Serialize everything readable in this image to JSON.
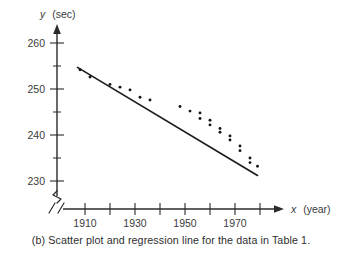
{
  "caption": "(b) Scatter plot and regression line for the data in Table 1.",
  "chart_data": {
    "type": "scatter",
    "title": "",
    "subtitle": "",
    "xlabel_var": "x",
    "xlabel_unit": "(year)",
    "ylabel_var": "y",
    "ylabel_unit": "(sec)",
    "xlabel": "x (year)",
    "ylabel": "y (sec)",
    "xlim": [
      1900,
      1982
    ],
    "ylim": [
      226,
      263
    ],
    "x_ticks_major": [
      1910,
      1930,
      1950,
      1970
    ],
    "x_ticks_all": [
      1910,
      1920,
      1930,
      1940,
      1950,
      1960,
      1970,
      1980
    ],
    "x_tick_labels": [
      "1910",
      "1930",
      "1950",
      "1970"
    ],
    "y_ticks_major": [
      230,
      240,
      250,
      260
    ],
    "y_ticks_minor": [
      235,
      245,
      255
    ],
    "y_tick_labels": [
      "230",
      "240",
      "250",
      "260"
    ],
    "grid": false,
    "legend": false,
    "axis_break_x": true,
    "axis_break_y": true,
    "points": [
      {
        "x": 1908,
        "y": 254.2
      },
      {
        "x": 1912,
        "y": 252.6
      },
      {
        "x": 1920,
        "y": 251.0
      },
      {
        "x": 1924,
        "y": 250.4
      },
      {
        "x": 1928,
        "y": 249.8
      },
      {
        "x": 1932,
        "y": 248.2
      },
      {
        "x": 1936,
        "y": 247.6
      },
      {
        "x": 1948,
        "y": 246.2
      },
      {
        "x": 1952,
        "y": 245.2
      },
      {
        "x": 1956,
        "y": 244.8
      },
      {
        "x": 1956,
        "y": 243.6
      },
      {
        "x": 1960,
        "y": 243.2
      },
      {
        "x": 1960,
        "y": 242.2
      },
      {
        "x": 1964,
        "y": 241.4
      },
      {
        "x": 1964,
        "y": 240.6
      },
      {
        "x": 1968,
        "y": 239.8
      },
      {
        "x": 1968,
        "y": 238.9
      },
      {
        "x": 1972,
        "y": 237.6
      },
      {
        "x": 1972,
        "y": 236.6
      },
      {
        "x": 1976,
        "y": 235.0
      },
      {
        "x": 1976,
        "y": 234.0
      },
      {
        "x": 1979,
        "y": 233.2
      }
    ],
    "regression_line": {
      "x_start": 1907,
      "y_start": 254.7,
      "x_end": 1979,
      "y_end": 231.2
    },
    "series": [
      {
        "name": "observations",
        "x": [
          1908,
          1912,
          1920,
          1924,
          1928,
          1932,
          1936,
          1948,
          1952,
          1956,
          1956,
          1960,
          1960,
          1964,
          1964,
          1968,
          1968,
          1972,
          1972,
          1976,
          1976,
          1979
        ],
        "values": [
          254.2,
          252.6,
          251.0,
          250.4,
          249.8,
          248.2,
          247.6,
          246.2,
          245.2,
          244.8,
          243.6,
          243.2,
          242.2,
          241.4,
          240.6,
          239.8,
          238.9,
          237.6,
          236.6,
          235.0,
          234.0,
          233.2
        ]
      }
    ]
  }
}
